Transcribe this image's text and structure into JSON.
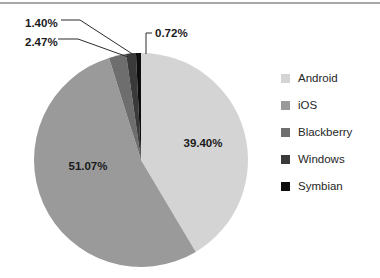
{
  "chart_data": {
    "type": "pie",
    "title": "",
    "subtitle": "",
    "xlabel": "",
    "ylabel": "",
    "grid": false,
    "legend_position": "right",
    "start_angle_deg": 0,
    "direction": "clockwise",
    "categories": [
      "Android",
      "iOS",
      "Blackberry",
      "Windows",
      "Symbian"
    ],
    "values": [
      39.4,
      51.07,
      2.47,
      1.4,
      0.72
    ],
    "value_labels": [
      "39.40%",
      "51.07%",
      "2.47%",
      "1.40%",
      "0.72%"
    ],
    "colors": [
      "#d4d4d4",
      "#9a9a9a",
      "#6e6e6e",
      "#3a3a3a",
      "#0d0d0d"
    ],
    "slices": [
      {
        "name": "Android",
        "value": 39.4,
        "label": "39.40%",
        "color": "#d4d4d4",
        "label_placement": "inside",
        "label_x": 203,
        "label_y": 147
      },
      {
        "name": "iOS",
        "value": 51.07,
        "label": "51.07%",
        "color": "#9a9a9a",
        "label_placement": "inside",
        "label_x": 88,
        "label_y": 170
      },
      {
        "name": "Blackberry",
        "value": 2.47,
        "label": "2.47%",
        "color": "#6e6e6e",
        "label_placement": "callout",
        "label_x": 25,
        "label_y": 42
      },
      {
        "name": "Windows",
        "value": 1.4,
        "label": "1.40%",
        "color": "#3a3a3a",
        "label_placement": "callout",
        "label_x": 25,
        "label_y": 23
      },
      {
        "name": "Symbian",
        "value": 0.72,
        "label": "0.72%",
        "color": "#0d0d0d",
        "label_placement": "callout",
        "label_x": 155,
        "label_y": 36
      }
    ],
    "geometry": {
      "center_x": 141,
      "center_y": 160,
      "radius": 107
    }
  },
  "legend": {
    "items": [
      {
        "label": "Android",
        "color": "#d4d4d4"
      },
      {
        "label": "iOS",
        "color": "#9a9a9a"
      },
      {
        "label": "Blackberry",
        "color": "#6e6e6e"
      },
      {
        "label": "Windows",
        "color": "#3a3a3a"
      },
      {
        "label": "Symbian",
        "color": "#0d0d0d"
      }
    ]
  }
}
